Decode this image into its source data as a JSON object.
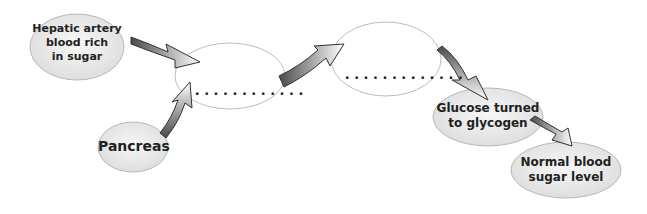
{
  "diagram": {
    "type": "flow-diagram",
    "nodes": [
      {
        "id": "hepatic",
        "label": "Hepatic artery blood rich in sugar",
        "lines": [
          "Hepatic artery",
          "blood rich",
          "in sugar"
        ],
        "filled": true
      },
      {
        "id": "blank1",
        "label": "",
        "dots": "............",
        "filled": false
      },
      {
        "id": "pancreas",
        "label": "Pancreas",
        "lines": [
          "Pancreas"
        ],
        "filled": true
      },
      {
        "id": "blank2",
        "label": "",
        "dots": ".............",
        "filled": false
      },
      {
        "id": "glucose",
        "label": "Glucose turned to glycogen",
        "lines": [
          "Glucose turned",
          "to glycogen"
        ],
        "filled": true
      },
      {
        "id": "normal",
        "label": "Normal blood sugar level",
        "lines": [
          "Normal blood",
          "sugar level"
        ],
        "filled": true
      }
    ],
    "edges": [
      {
        "from": "hepatic",
        "to": "blank1"
      },
      {
        "from": "pancreas",
        "to": "blank1"
      },
      {
        "from": "blank1",
        "to": "blank2"
      },
      {
        "from": "blank2",
        "to": "glucose"
      },
      {
        "from": "glucose",
        "to": "normal"
      }
    ],
    "colors": {
      "node_fill": "#e6e6e6",
      "node_stroke": "#b5b5b5",
      "arrow_dark": "#555555",
      "arrow_light": "#ffffff"
    }
  }
}
